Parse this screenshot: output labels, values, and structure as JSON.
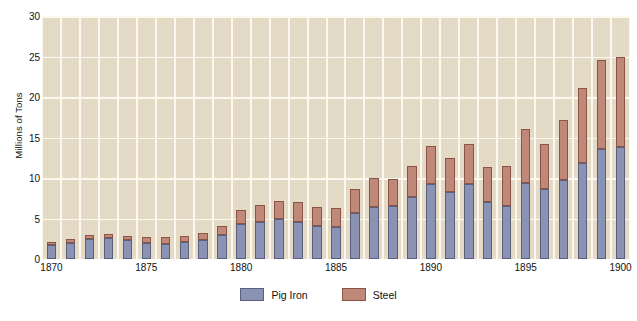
{
  "chart_data": {
    "type": "bar",
    "subtype": "stacked",
    "title": "",
    "xlabel": "",
    "ylabel": "Millions of Tons",
    "ylim": [
      0,
      30
    ],
    "yticks": [
      0,
      5,
      10,
      15,
      20,
      25,
      30
    ],
    "xticks": [
      "1870",
      "1875",
      "1880",
      "1885",
      "1890",
      "1895",
      "1900"
    ],
    "grid": true,
    "legend_position": "bottom-center",
    "categories": [
      "1870",
      "1871",
      "1872",
      "1873",
      "1874",
      "1875",
      "1876",
      "1877",
      "1878",
      "1879",
      "1880",
      "1881",
      "1882",
      "1883",
      "1884",
      "1885",
      "1886",
      "1887",
      "1888",
      "1889",
      "1890",
      "1891",
      "1892",
      "1893",
      "1894",
      "1895",
      "1896",
      "1897",
      "1898",
      "1899",
      "1900"
    ],
    "series": [
      {
        "name": "Pig Iron",
        "color": "#8b93b5",
        "edge_color": "#5a5f7d",
        "values": [
          1.7,
          2.0,
          2.5,
          2.6,
          2.4,
          2.0,
          1.9,
          2.1,
          2.3,
          3.0,
          4.3,
          4.6,
          4.9,
          4.6,
          4.1,
          4.0,
          5.7,
          6.4,
          6.5,
          7.6,
          9.2,
          8.3,
          9.2,
          7.1,
          6.6,
          9.4,
          8.6,
          9.7,
          11.8,
          13.6,
          13.8
        ]
      },
      {
        "name": "Steel",
        "color": "#c08878",
        "edge_color": "#8a5446",
        "values": [
          0.4,
          0.5,
          0.5,
          0.5,
          0.5,
          0.7,
          0.8,
          0.7,
          0.9,
          1.1,
          1.8,
          2.1,
          2.3,
          2.4,
          2.3,
          2.3,
          3.0,
          3.6,
          3.4,
          3.9,
          4.8,
          4.2,
          5.0,
          4.3,
          4.9,
          6.6,
          5.6,
          7.5,
          9.3,
          11.0,
          11.2
        ]
      }
    ],
    "totals": [
      2.1,
      2.5,
      3.0,
      3.1,
      2.9,
      2.7,
      2.7,
      2.8,
      3.2,
      4.1,
      6.1,
      6.7,
      7.2,
      7.0,
      6.4,
      6.3,
      8.7,
      10.0,
      9.9,
      11.5,
      14.0,
      12.5,
      14.2,
      11.4,
      11.5,
      16.0,
      14.2,
      17.2,
      21.1,
      24.6,
      25.0
    ],
    "background_color": "#e6dcc6",
    "gridline_color": "#fdfaf2"
  },
  "axis": {
    "y_title": "Millions of Tons",
    "y_labels": [
      "0",
      "5",
      "10",
      "15",
      "20",
      "25",
      "30"
    ],
    "x_labels": [
      "1870",
      "1875",
      "1880",
      "1885",
      "1890",
      "1895",
      "1900"
    ]
  },
  "legend": {
    "items": [
      {
        "label": "Pig Iron",
        "swatch": "pig-iron-swatch"
      },
      {
        "label": "Steel",
        "swatch": "steel-swatch"
      }
    ]
  }
}
